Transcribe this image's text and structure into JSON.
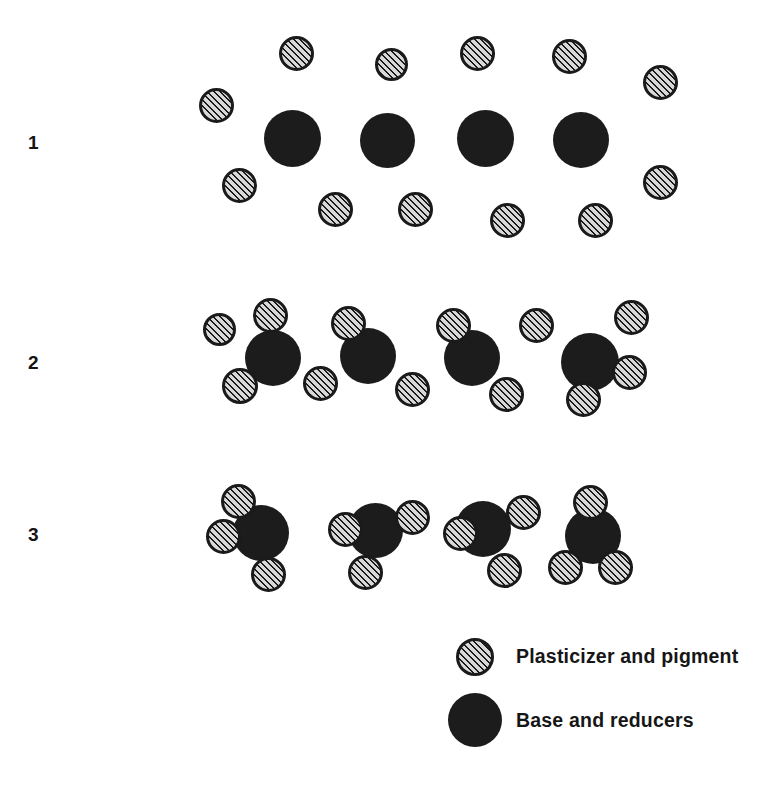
{
  "figure": {
    "width": 763,
    "height": 785,
    "background": "#ffffff"
  },
  "colors": {
    "hatch_line": "#1a1a1a",
    "hatch_fill": "#d8d8d8",
    "solid_particle": "#1c1c1c",
    "text": "#161616",
    "background": "#ffffff"
  },
  "particle_types": {
    "small": {
      "name": "Plasticizer and pigment",
      "diameter": 33,
      "style": "diagonal-hatch-45"
    },
    "large": {
      "name": "Base and reducers",
      "diameter": 56,
      "style": "solid-black"
    }
  },
  "rows": [
    {
      "label": "1",
      "label_x": 28,
      "label_y": 133,
      "stage_name": "separated",
      "large": [
        {
          "x": 264,
          "y": 110,
          "d": 57
        },
        {
          "x": 360,
          "y": 113,
          "d": 55
        },
        {
          "x": 457,
          "y": 110,
          "d": 57
        },
        {
          "x": 553,
          "y": 112,
          "d": 56
        }
      ],
      "small": [
        {
          "x": 279,
          "y": 36,
          "d": 35
        },
        {
          "x": 375,
          "y": 48,
          "d": 33
        },
        {
          "x": 460,
          "y": 36,
          "d": 35
        },
        {
          "x": 552,
          "y": 39,
          "d": 35
        },
        {
          "x": 643,
          "y": 65,
          "d": 35
        },
        {
          "x": 199,
          "y": 88,
          "d": 35
        },
        {
          "x": 222,
          "y": 168,
          "d": 35
        },
        {
          "x": 643,
          "y": 165,
          "d": 35
        },
        {
          "x": 318,
          "y": 192,
          "d": 35
        },
        {
          "x": 398,
          "y": 192,
          "d": 35
        },
        {
          "x": 490,
          "y": 203,
          "d": 35
        },
        {
          "x": 578,
          "y": 203,
          "d": 35
        }
      ]
    },
    {
      "label": "2",
      "label_x": 28,
      "label_y": 353,
      "stage_name": "partially wetted",
      "large": [
        {
          "x": 245,
          "y": 330,
          "d": 56
        },
        {
          "x": 340,
          "y": 328,
          "d": 56
        },
        {
          "x": 444,
          "y": 330,
          "d": 56
        },
        {
          "x": 561,
          "y": 333,
          "d": 58
        }
      ],
      "small": [
        {
          "x": 203,
          "y": 313,
          "d": 33
        },
        {
          "x": 253,
          "y": 298,
          "d": 35
        },
        {
          "x": 331,
          "y": 306,
          "d": 35
        },
        {
          "x": 436,
          "y": 308,
          "d": 35
        },
        {
          "x": 519,
          "y": 308,
          "d": 35
        },
        {
          "x": 614,
          "y": 300,
          "d": 35
        },
        {
          "x": 222,
          "y": 368,
          "d": 36
        },
        {
          "x": 303,
          "y": 366,
          "d": 35
        },
        {
          "x": 395,
          "y": 372,
          "d": 35
        },
        {
          "x": 489,
          "y": 377,
          "d": 35
        },
        {
          "x": 612,
          "y": 355,
          "d": 35
        },
        {
          "x": 566,
          "y": 382,
          "d": 35
        }
      ]
    },
    {
      "label": "3",
      "label_x": 28,
      "label_y": 525,
      "stage_name": "fully dispersed",
      "large": [
        {
          "x": 233,
          "y": 505,
          "d": 56
        },
        {
          "x": 348,
          "y": 503,
          "d": 55
        },
        {
          "x": 455,
          "y": 501,
          "d": 56
        },
        {
          "x": 565,
          "y": 508,
          "d": 56
        }
      ],
      "small": [
        {
          "x": 221,
          "y": 484,
          "d": 35
        },
        {
          "x": 206,
          "y": 519,
          "d": 35
        },
        {
          "x": 251,
          "y": 557,
          "d": 35
        },
        {
          "x": 328,
          "y": 512,
          "d": 35
        },
        {
          "x": 395,
          "y": 500,
          "d": 35
        },
        {
          "x": 348,
          "y": 555,
          "d": 35
        },
        {
          "x": 443,
          "y": 516,
          "d": 35
        },
        {
          "x": 506,
          "y": 495,
          "d": 35
        },
        {
          "x": 487,
          "y": 553,
          "d": 35
        },
        {
          "x": 573,
          "y": 485,
          "d": 35
        },
        {
          "x": 548,
          "y": 550,
          "d": 35
        },
        {
          "x": 598,
          "y": 550,
          "d": 35
        }
      ]
    }
  ],
  "legend": {
    "items": [
      {
        "label": "Plasticizer and pigment",
        "swatch_type": "small",
        "swatch_x": 456,
        "swatch_y": 638,
        "swatch_d": 38,
        "text_x": 516,
        "text_y": 647
      },
      {
        "label": "Base and reducers",
        "swatch_type": "large",
        "swatch_x": 448,
        "swatch_y": 693,
        "swatch_d": 54,
        "text_x": 516,
        "text_y": 711
      }
    ]
  }
}
